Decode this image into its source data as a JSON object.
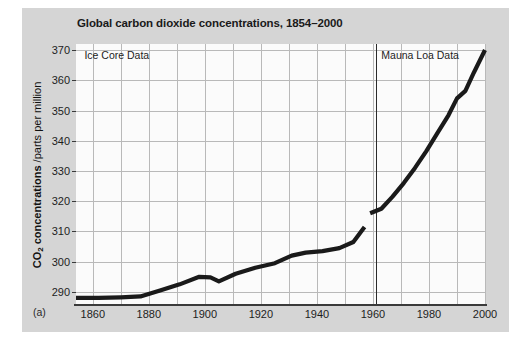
{
  "figure": {
    "panel_letter": "(a)",
    "title": "Global carbon dioxide concentrations, 1854–2000",
    "background_color": "#d5d5d5",
    "plot_background_color": "#fbfbfb",
    "line_color": "#1a1a1a",
    "grid_color": "#b9b9b9"
  },
  "chart_data": {
    "type": "line",
    "title": "Global carbon dioxide concentrations, 1854–2000",
    "xlabel": "",
    "ylabel": "CO2 concentrations /parts per million",
    "ylabel_main": "CO",
    "ylabel_sub": "2",
    "ylabel_rest": " concentrations",
    "ylabel_unit": " /parts per million",
    "xlim": [
      1854,
      2000
    ],
    "ylim": [
      286,
      372
    ],
    "grid": true,
    "legend_position": "in-plot-annotations",
    "yticks": [
      290,
      300,
      310,
      320,
      330,
      340,
      350,
      360,
      370
    ],
    "xticks": [
      1860,
      1880,
      1900,
      1920,
      1940,
      1960,
      1980,
      2000
    ],
    "xgridlines": [
      1860,
      1870,
      1880,
      1890,
      1900,
      1910,
      1920,
      1930,
      1940,
      1950,
      1960,
      1970,
      1980,
      1990,
      2000
    ],
    "divider_x": 1961,
    "annotations": [
      {
        "text": "Ice Core Data",
        "x": 1857,
        "y": 368
      },
      {
        "text": "Mauna Loa Data",
        "x": 1963,
        "y": 368
      }
    ],
    "series": [
      {
        "name": "Ice Core Data",
        "x": [
          1854,
          1862,
          1870,
          1877,
          1884,
          1891,
          1898,
          1902,
          1905,
          1911,
          1918,
          1925,
          1931,
          1936,
          1942,
          1948,
          1953,
          1957
        ],
        "values": [
          288.0,
          288.0,
          288.2,
          288.5,
          290.5,
          292.5,
          295.0,
          294.8,
          293.5,
          296.0,
          298.0,
          299.5,
          302.0,
          303.0,
          303.5,
          304.5,
          306.5,
          311.5
        ]
      },
      {
        "name": "Mauna Loa Data",
        "x": [
          1959,
          1963,
          1967,
          1971,
          1975,
          1979,
          1983,
          1987,
          1990,
          1993,
          1996,
          2000
        ],
        "values": [
          316.0,
          317.5,
          321.5,
          326.0,
          331.0,
          336.5,
          342.5,
          348.5,
          354.0,
          356.5,
          362.5,
          370.0
        ]
      }
    ]
  }
}
